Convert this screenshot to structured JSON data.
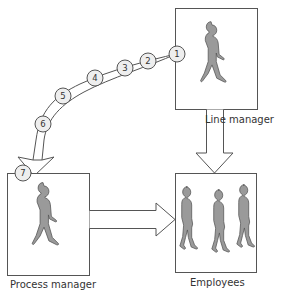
{
  "diagram": {
    "type": "process flow",
    "nodes": {
      "line_manager": {
        "label": "Line manager",
        "figure_count": 1
      },
      "process_manager": {
        "label": "Process manager",
        "figure_count": 1
      },
      "employees": {
        "label": "Employees",
        "figure_count": 3
      }
    },
    "steps": [
      "1",
      "2",
      "3",
      "4",
      "5",
      "6",
      "7"
    ],
    "edges": [
      {
        "from": "line_manager",
        "to": "process_manager",
        "style": "curved arrow through numbered steps 1–7"
      },
      {
        "from": "line_manager",
        "to": "employees",
        "style": "block arrow down"
      },
      {
        "from": "process_manager",
        "to": "employees",
        "style": "block arrow right"
      }
    ],
    "colors": {
      "stroke": "#555555",
      "figure_fill": "#9a9a9a",
      "step_fill": "#eeeeee",
      "background": "#ffffff"
    }
  }
}
